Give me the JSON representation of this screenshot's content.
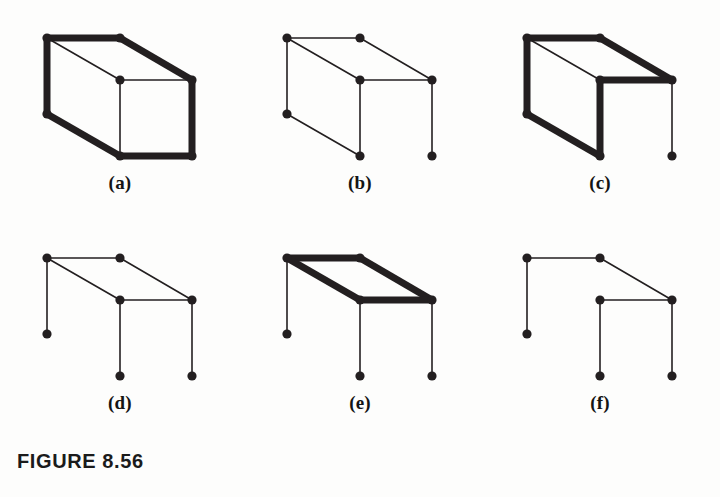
{
  "figure": {
    "caption": "FIGURE 8.56",
    "background_color": "#fdfdfc",
    "ink_color": "#231f20",
    "thin_stroke_width": 1.6,
    "bold_stroke_width": 7.0,
    "vertex_radius": 4.6,
    "panel_width": 240,
    "panel_height": 220,
    "columns": 3,
    "rows": 2
  },
  "vertices": {
    "back_top_left": {
      "id": "BTL",
      "x": 47,
      "y": 38
    },
    "back_top_right": {
      "id": "BTR",
      "x": 120,
      "y": 38
    },
    "front_top_left": {
      "id": "FTL",
      "x": 120,
      "y": 80
    },
    "front_top_right": {
      "id": "FTR",
      "x": 192,
      "y": 80
    },
    "back_bottom_left": {
      "id": "BBL",
      "x": 47,
      "y": 114
    },
    "back_bottom_right": {
      "id": "BBR",
      "x": 120,
      "y": 114
    },
    "front_bottom_left": {
      "id": "FBL",
      "x": 120,
      "y": 156
    },
    "front_bottom_right": {
      "id": "FBR",
      "x": 192,
      "y": 156
    }
  },
  "panels": [
    {
      "label": "(a)",
      "name": "panel-a-cube",
      "description": "complete cube graph with outer hexagon edges drawn bold",
      "vertices": [
        "BTL",
        "BTR",
        "FTL",
        "FTR",
        "BBL",
        "FBL",
        "FBR"
      ],
      "edges": [
        {
          "from": "BTL",
          "to": "BTR",
          "weight": "bold"
        },
        {
          "from": "BTR",
          "to": "FTR",
          "weight": "bold"
        },
        {
          "from": "BTL",
          "to": "BBL",
          "weight": "bold"
        },
        {
          "from": "BBL",
          "to": "FBL",
          "weight": "bold"
        },
        {
          "from": "FBL",
          "to": "FBR",
          "weight": "bold"
        },
        {
          "from": "FTR",
          "to": "FBR",
          "weight": "bold"
        },
        {
          "from": "BTL",
          "to": "FTL",
          "weight": "thin"
        },
        {
          "from": "FTL",
          "to": "FTR",
          "weight": "thin"
        },
        {
          "from": "FTL",
          "to": "FBL",
          "weight": "thin"
        }
      ]
    },
    {
      "label": "(b)",
      "name": "panel-b-spanning-tree",
      "description": "spanning tree, all edges thin",
      "vertices": [
        "BTL",
        "BTR",
        "FTL",
        "FTR",
        "BBL",
        "FBL",
        "FBR"
      ],
      "edges": [
        {
          "from": "BTL",
          "to": "BTR",
          "weight": "thin"
        },
        {
          "from": "BTR",
          "to": "FTR",
          "weight": "thin"
        },
        {
          "from": "BTL",
          "to": "FTL",
          "weight": "thin"
        },
        {
          "from": "FTL",
          "to": "FTR",
          "weight": "thin"
        },
        {
          "from": "BTL",
          "to": "BBL",
          "weight": "thin"
        },
        {
          "from": "BBL",
          "to": "FBL",
          "weight": "thin"
        },
        {
          "from": "FTL",
          "to": "FBL",
          "weight": "thin"
        },
        {
          "from": "FTR",
          "to": "FBR",
          "weight": "thin"
        }
      ]
    },
    {
      "label": "(c)",
      "name": "panel-c-spanning-tree-bold",
      "description": "same spanning tree as (b) with six edges bold",
      "vertices": [
        "BTL",
        "BTR",
        "FTL",
        "FTR",
        "BBL",
        "FBL",
        "FBR"
      ],
      "edges": [
        {
          "from": "BTL",
          "to": "BTR",
          "weight": "bold"
        },
        {
          "from": "BTR",
          "to": "FTR",
          "weight": "bold"
        },
        {
          "from": "FTL",
          "to": "FTR",
          "weight": "bold"
        },
        {
          "from": "BTL",
          "to": "BBL",
          "weight": "bold"
        },
        {
          "from": "BBL",
          "to": "FBL",
          "weight": "bold"
        },
        {
          "from": "FTL",
          "to": "FBL",
          "weight": "bold"
        },
        {
          "from": "BTL",
          "to": "FTL",
          "weight": "thin"
        },
        {
          "from": "FTR",
          "to": "FBR",
          "weight": "thin"
        }
      ]
    },
    {
      "label": "(d)",
      "name": "panel-d-star-tree",
      "description": "top face plus three pendant verticals, all thin",
      "vertices": [
        "BTL",
        "BTR",
        "FTL",
        "FTR",
        "BBL",
        "FBL",
        "FBR"
      ],
      "edges": [
        {
          "from": "BTL",
          "to": "BTR",
          "weight": "thin"
        },
        {
          "from": "BTR",
          "to": "FTR",
          "weight": "thin"
        },
        {
          "from": "BTL",
          "to": "FTL",
          "weight": "thin"
        },
        {
          "from": "FTL",
          "to": "FTR",
          "weight": "thin"
        },
        {
          "from": "BTL",
          "to": "BBL",
          "weight": "thin"
        },
        {
          "from": "FTL",
          "to": "FBL",
          "weight": "thin"
        },
        {
          "from": "FTR",
          "to": "FBR",
          "weight": "thin"
        }
      ]
    },
    {
      "label": "(e)",
      "name": "panel-e-bold-top-face",
      "description": "top face cycle drawn bold, three pendant verticals thin",
      "vertices": [
        "BTL",
        "BTR",
        "FTL",
        "FTR",
        "BBL",
        "FBL",
        "FBR"
      ],
      "edges": [
        {
          "from": "BTL",
          "to": "BTR",
          "weight": "bold"
        },
        {
          "from": "BTR",
          "to": "FTR",
          "weight": "bold"
        },
        {
          "from": "BTL",
          "to": "FTL",
          "weight": "bold"
        },
        {
          "from": "FTL",
          "to": "FTR",
          "weight": "bold"
        },
        {
          "from": "BTL",
          "to": "BBL",
          "weight": "thin"
        },
        {
          "from": "FTL",
          "to": "FBL",
          "weight": "thin"
        },
        {
          "from": "FTR",
          "to": "FBR",
          "weight": "thin"
        }
      ]
    },
    {
      "label": "(f)",
      "name": "panel-f-path-tree",
      "description": "tree without the back-top-left to front-top-left diagonal",
      "vertices": [
        "BTL",
        "BTR",
        "FTL",
        "FTR",
        "BBL",
        "FBL",
        "FBR"
      ],
      "edges": [
        {
          "from": "BTL",
          "to": "BTR",
          "weight": "thin"
        },
        {
          "from": "BTR",
          "to": "FTR",
          "weight": "thin"
        },
        {
          "from": "FTL",
          "to": "FTR",
          "weight": "thin"
        },
        {
          "from": "BTL",
          "to": "BBL",
          "weight": "thin"
        },
        {
          "from": "FTL",
          "to": "FBL",
          "weight": "thin"
        },
        {
          "from": "FTR",
          "to": "FBR",
          "weight": "thin"
        }
      ]
    }
  ]
}
